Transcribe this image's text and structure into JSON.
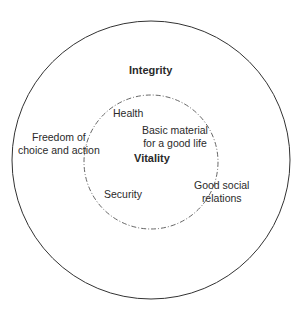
{
  "diagram": {
    "outer_circle": {
      "label": "Integrity",
      "stroke": "#333333"
    },
    "inner_circle": {
      "label": "Vitality",
      "stroke": "#444444",
      "style": "dash-dot"
    },
    "inner_items": {
      "health": "Health",
      "basic_material_1": "Basic material",
      "basic_material_2": "for a good life",
      "security": "Security"
    },
    "outer_items": {
      "freedom_1": "Freedom of",
      "freedom_2": "choice and action",
      "social_1": "Good social",
      "social_2": "relations"
    }
  }
}
